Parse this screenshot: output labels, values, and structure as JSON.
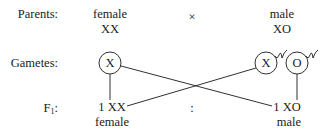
{
  "row_labels": {
    "parents": "Parents:",
    "gametes": "Gametes:",
    "f1_main": "F",
    "f1_sub": "1",
    "f1_colon": ":"
  },
  "parents": {
    "female": {
      "sex": "female",
      "genotype": "XX"
    },
    "cross_symbol": "×",
    "male": {
      "sex": "male",
      "genotype": "XO"
    }
  },
  "gametes": {
    "female": [
      {
        "label": "X",
        "type": "egg"
      }
    ],
    "male": [
      {
        "label": "X",
        "type": "sperm"
      },
      {
        "label": "O",
        "type": "sperm"
      }
    ]
  },
  "offspring": {
    "left": {
      "ratio_genotype": "1 XX",
      "sex": "female"
    },
    "ratio_separator": ":",
    "right": {
      "ratio_genotype": "1 XO",
      "sex": "male"
    }
  },
  "colors": {
    "ink": "#1a1a1a",
    "background": "#ffffff"
  }
}
